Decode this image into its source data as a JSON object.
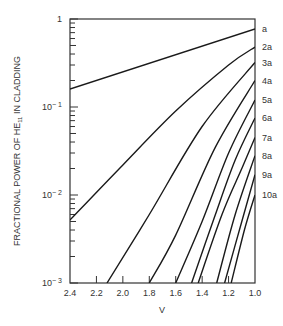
{
  "chart_data": {
    "type": "line",
    "title": "",
    "xlabel": "V",
    "ylabel": "FRACTIONAL POWER OF HE11 IN CLADDING",
    "ylabel_parts": {
      "pre": "FRACTIONAL POWER OF HE",
      "sub": "11",
      "post": " IN CLADDING"
    },
    "xscale": "linear",
    "yscale": "log",
    "xlim": [
      2.4,
      1.0
    ],
    "ylim": [
      0.001,
      1
    ],
    "x_ticks": [
      "2.4",
      "2.2",
      "2.0",
      "1.8",
      "1.6",
      "1.4",
      "1.2",
      "1.0"
    ],
    "x_tick_values": [
      2.4,
      2.2,
      2.0,
      1.8,
      1.6,
      1.4,
      1.2,
      1.0
    ],
    "y_ticks": [
      {
        "value": 1,
        "base": "1",
        "exp": ""
      },
      {
        "value": 0.1,
        "base": "10",
        "exp": "− 1"
      },
      {
        "value": 0.01,
        "base": "10",
        "exp": "− 2"
      },
      {
        "value": 0.001,
        "base": "10",
        "exp": "− 3"
      }
    ],
    "grid": false,
    "legend": "curve labels at right edge",
    "series": [
      {
        "name": "a",
        "points": [
          [
            2.4,
            0.16
          ],
          [
            1.0,
            0.77
          ]
        ]
      },
      {
        "name": "2a",
        "points": [
          [
            2.4,
            0.0052
          ],
          [
            2.0,
            0.022
          ],
          [
            1.6,
            0.09
          ],
          [
            1.2,
            0.3
          ],
          [
            1.0,
            0.48
          ]
        ]
      },
      {
        "name": "3a",
        "points": [
          [
            2.12,
            0.001
          ],
          [
            1.8,
            0.006
          ],
          [
            1.4,
            0.06
          ],
          [
            1.0,
            0.32
          ]
        ]
      },
      {
        "name": "4a",
        "points": [
          [
            1.8,
            0.001
          ],
          [
            1.6,
            0.0035
          ],
          [
            1.3,
            0.035
          ],
          [
            1.0,
            0.2
          ]
        ]
      },
      {
        "name": "5a",
        "points": [
          [
            1.6,
            0.001
          ],
          [
            1.4,
            0.005
          ],
          [
            1.2,
            0.03
          ],
          [
            1.0,
            0.12
          ]
        ]
      },
      {
        "name": "6a",
        "points": [
          [
            1.48,
            0.001
          ],
          [
            1.3,
            0.006
          ],
          [
            1.15,
            0.025
          ],
          [
            1.0,
            0.075
          ]
        ]
      },
      {
        "name": "7a",
        "points": [
          [
            1.43,
            0.001
          ],
          [
            1.25,
            0.006
          ],
          [
            1.1,
            0.02
          ],
          [
            1.0,
            0.045
          ]
        ]
      },
      {
        "name": "8a",
        "points": [
          [
            1.29,
            0.001
          ],
          [
            1.15,
            0.006
          ],
          [
            1.0,
            0.028
          ]
        ]
      },
      {
        "name": "9a",
        "points": [
          [
            1.23,
            0.001
          ],
          [
            1.1,
            0.005
          ],
          [
            1.0,
            0.017
          ]
        ]
      },
      {
        "name": "10a",
        "points": [
          [
            1.18,
            0.001
          ],
          [
            1.08,
            0.004
          ],
          [
            1.0,
            0.01
          ]
        ]
      }
    ]
  }
}
